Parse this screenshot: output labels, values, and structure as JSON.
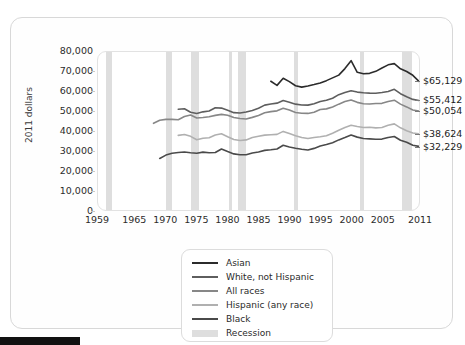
{
  "axis": {
    "y_title": "2011 dollars",
    "y_ticks": [
      "80,000",
      "70,000",
      "60,000",
      "50,000",
      "40,000",
      "30,000",
      "20,000",
      "10,000",
      "0"
    ],
    "x_ticks": [
      "1959",
      "1965",
      "1970",
      "1975",
      "1980",
      "1985",
      "1990",
      "1995",
      "2000",
      "2005",
      "2011"
    ]
  },
  "end_labels": [
    {
      "text": "$65,129",
      "series": "Asian"
    },
    {
      "text": "$55,412",
      "series": "White, not Hispanic"
    },
    {
      "text": "$50,054",
      "series": "All races"
    },
    {
      "text": "$38,624",
      "series": "Hispanic (any race)"
    },
    {
      "text": "$32,229",
      "series": "Black"
    }
  ],
  "legend": {
    "items": [
      {
        "label": "Asian",
        "color": "#2b2b2b",
        "type": "line"
      },
      {
        "label": "White, not Hispanic",
        "color": "#5e5e5e",
        "type": "line"
      },
      {
        "label": "All races",
        "color": "#878787",
        "type": "line"
      },
      {
        "label": "Hispanic (any race)",
        "color": "#b0b0b0",
        "type": "line"
      },
      {
        "label": "Black",
        "color": "#4a4a4a",
        "type": "line"
      },
      {
        "label": "Recession",
        "color": "#dedede",
        "type": "block"
      }
    ]
  },
  "chart_data": {
    "type": "line",
    "title": "",
    "subtitle": "",
    "xlabel": "",
    "ylabel": "2011 dollars",
    "xlim": [
      1959,
      2011
    ],
    "ylim": [
      0,
      80000
    ],
    "grid": false,
    "legend_position": "bottom-center",
    "x": [
      1959,
      1960,
      1961,
      1962,
      1963,
      1964,
      1965,
      1966,
      1967,
      1968,
      1969,
      1970,
      1971,
      1972,
      1973,
      1974,
      1975,
      1976,
      1977,
      1978,
      1979,
      1980,
      1981,
      1982,
      1983,
      1984,
      1985,
      1986,
      1987,
      1988,
      1989,
      1990,
      1991,
      1992,
      1993,
      1994,
      1995,
      1996,
      1997,
      1998,
      1999,
      2000,
      2001,
      2002,
      2003,
      2004,
      2005,
      2006,
      2007,
      2008,
      2009,
      2010,
      2011
    ],
    "series": [
      {
        "name": "Asian",
        "color": "#2b2b2b",
        "end_value": 65129,
        "start_year": 1987,
        "values": [
          null,
          null,
          null,
          null,
          null,
          null,
          null,
          null,
          null,
          null,
          null,
          null,
          null,
          null,
          null,
          null,
          null,
          null,
          null,
          null,
          null,
          null,
          null,
          null,
          null,
          null,
          null,
          null,
          65200,
          63100,
          66700,
          65000,
          62900,
          62200,
          62800,
          63500,
          64300,
          65500,
          66900,
          68300,
          71600,
          75600,
          69700,
          69000,
          69200,
          70200,
          71900,
          73500,
          74100,
          71500,
          70100,
          68200,
          65129
        ]
      },
      {
        "name": "White, not Hispanic",
        "color": "#5e5e5e",
        "end_value": 55412,
        "start_year": 1972,
        "values": [
          null,
          null,
          null,
          null,
          null,
          null,
          null,
          null,
          null,
          null,
          null,
          null,
          null,
          51000,
          51300,
          49500,
          48900,
          49700,
          50100,
          51800,
          51600,
          50500,
          49300,
          49100,
          49600,
          50400,
          51500,
          53100,
          53700,
          54100,
          55400,
          54600,
          53600,
          53200,
          53100,
          53800,
          54900,
          55600,
          56600,
          58400,
          59500,
          60400,
          59700,
          59400,
          59200,
          59100,
          59500,
          60000,
          61100,
          58900,
          57300,
          56000,
          55412
        ]
      },
      {
        "name": "All races",
        "color": "#878787",
        "end_value": 50054,
        "start_year": 1967,
        "values": [
          null,
          null,
          null,
          null,
          null,
          null,
          null,
          null,
          null,
          43900,
          45400,
          45900,
          45900,
          45700,
          47300,
          48100,
          46600,
          46800,
          47200,
          47900,
          48400,
          48000,
          46800,
          46300,
          46100,
          46900,
          47900,
          49200,
          49800,
          50200,
          51500,
          50600,
          49400,
          49000,
          48900,
          49500,
          50900,
          51200,
          52200,
          53600,
          54900,
          55700,
          54500,
          53800,
          53700,
          53900,
          54000,
          54900,
          55600,
          53600,
          52200,
          50600,
          50054
        ]
      },
      {
        "name": "Hispanic (any race)",
        "color": "#b0b0b0",
        "end_value": 38624,
        "start_year": 1972,
        "values": [
          null,
          null,
          null,
          null,
          null,
          null,
          null,
          null,
          null,
          null,
          null,
          null,
          null,
          37800,
          38200,
          37300,
          35600,
          36300,
          36600,
          38000,
          38600,
          37100,
          35700,
          35200,
          35500,
          36700,
          37300,
          37900,
          38100,
          38300,
          39800,
          38700,
          37600,
          36700,
          36200,
          36700,
          37100,
          37600,
          38900,
          40400,
          41800,
          42900,
          42300,
          41800,
          41900,
          41600,
          41800,
          42900,
          43600,
          41600,
          40100,
          39000,
          38624
        ]
      },
      {
        "name": "Black",
        "color": "#4a4a4a",
        "end_value": 32229,
        "start_year": 1967,
        "values": [
          null,
          null,
          null,
          null,
          null,
          null,
          null,
          null,
          null,
          null,
          26100,
          27800,
          28700,
          29100,
          29400,
          29000,
          28700,
          29300,
          29000,
          29100,
          30900,
          29600,
          28400,
          28000,
          28000,
          28900,
          29400,
          30200,
          30500,
          30900,
          32800,
          31900,
          31300,
          30800,
          30400,
          31200,
          32400,
          33200,
          34100,
          35500,
          36700,
          38000,
          36900,
          36200,
          36000,
          35800,
          35900,
          36700,
          37200,
          35300,
          34300,
          32800,
          32229
        ]
      }
    ],
    "recessions": [
      {
        "start": 1960.3,
        "end": 1961.2
      },
      {
        "start": 1969.9,
        "end": 1970.9
      },
      {
        "start": 1973.9,
        "end": 1975.2
      },
      {
        "start": 1980.1,
        "end": 1980.6
      },
      {
        "start": 1981.6,
        "end": 1982.9
      },
      {
        "start": 1990.6,
        "end": 1991.2
      },
      {
        "start": 2001.2,
        "end": 2001.9
      },
      {
        "start": 2007.9,
        "end": 2009.5
      }
    ]
  }
}
